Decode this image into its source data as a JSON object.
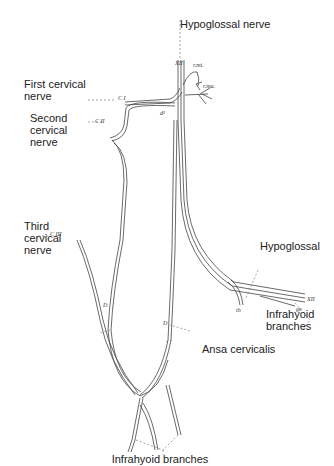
{
  "labels": {
    "hypoglossal_nerve": "Hypoglossal nerve",
    "first_cervical": "First cervical\nnerve",
    "second_cervical": "Second\ncervical\nnerve",
    "third_cervical": "Third\ncervical\nnerve",
    "hypoglossal": "Hypoglossal",
    "infrahyoid_right": "Infrahyoid\nbranches",
    "ansa_cervicalis": "Ansa cervicalis",
    "infrahyoid_bottom": "Infrahyoid branches"
  },
  "small_labels": {
    "c1": "C I",
    "c2": "C II",
    "c3": "C III",
    "xii_top": "XII",
    "rmi": "r.mi.",
    "rma": "r.ma.",
    "d1": "d¹",
    "d_left": "D",
    "d_right": "D",
    "xii_right": "XII",
    "ge": "ge",
    "th": "th"
  }
}
